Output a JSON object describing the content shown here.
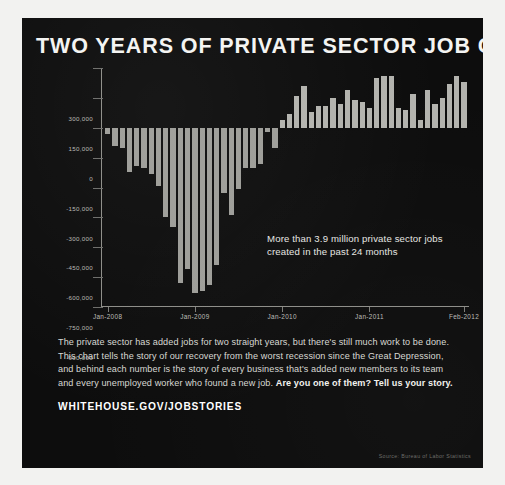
{
  "poster": {
    "title": "TWO YEARS OF PRIVATE SECTOR JOB GROWTH",
    "callout": "More than 3.9 million private sector jobs created in the past 24 months",
    "paragraph_part1": "The private sector has added jobs for two straight years, but there's still much work to be done. This chart tells the story of our recovery from the worst recession since the Great Depression, and behind each number is the story of every business that's added new members to its team and every unemployed worker who found a new job. ",
    "paragraph_emphasis": "Are you one of them? Tell us your story.",
    "cta": "WHITEHOUSE.GOV/JOBSTORIES",
    "source": "Source: Bureau of Labor Statistics",
    "background_color": "#0d0d0d",
    "bar_color": "#b3b3ae",
    "text_color": "#f4f4f2"
  },
  "chart_data": {
    "type": "bar",
    "title": "TWO YEARS OF PRIVATE SECTOR JOB GROWTH",
    "xlabel": "",
    "ylabel": "",
    "ylim": [
      -900000,
      300000
    ],
    "grid": true,
    "legend": "none",
    "ytick_labels": [
      "300,000",
      "150,000",
      "0",
      "-150,000",
      "-300,000",
      "-450,000",
      "-600,000",
      "-750,000",
      "-900,000"
    ],
    "ytick_values": [
      300000,
      150000,
      0,
      -150000,
      -300000,
      -450000,
      -600000,
      -750000,
      -900000
    ],
    "xtick_labels": [
      "Jan-2008",
      "Jan-2009",
      "Jan-2010",
      "Jan-2011",
      "Feb-2012"
    ],
    "xtick_indices": [
      0,
      12,
      24,
      36,
      49
    ],
    "annotations": [
      {
        "text": "More than 3.9 million private sector jobs created in the past 24 months",
        "x_index": 30,
        "y_value": -330000
      }
    ],
    "categories": [
      "Jan-2008",
      "Feb-2008",
      "Mar-2008",
      "Apr-2008",
      "May-2008",
      "Jun-2008",
      "Jul-2008",
      "Aug-2008",
      "Sep-2008",
      "Oct-2008",
      "Nov-2008",
      "Dec-2008",
      "Jan-2009",
      "Feb-2009",
      "Mar-2009",
      "Apr-2009",
      "May-2009",
      "Jun-2009",
      "Jul-2009",
      "Aug-2009",
      "Sep-2009",
      "Oct-2009",
      "Nov-2009",
      "Dec-2009",
      "Jan-2010",
      "Feb-2010",
      "Mar-2010",
      "Apr-2010",
      "May-2010",
      "Jun-2010",
      "Jul-2010",
      "Aug-2010",
      "Sep-2010",
      "Oct-2010",
      "Nov-2010",
      "Dec-2010",
      "Jan-2011",
      "Feb-2011",
      "Mar-2011",
      "Apr-2011",
      "May-2011",
      "Jun-2011",
      "Jul-2011",
      "Aug-2011",
      "Sep-2011",
      "Oct-2011",
      "Nov-2011",
      "Dec-2011",
      "Jan-2012",
      "Feb-2012"
    ],
    "values": [
      -30000,
      -90000,
      -100000,
      -220000,
      -190000,
      -200000,
      -230000,
      -290000,
      -450000,
      -500000,
      -780000,
      -710000,
      -830000,
      -820000,
      -790000,
      -690000,
      -330000,
      -440000,
      -310000,
      -200000,
      -200000,
      -180000,
      -20000,
      -100000,
      40000,
      70000,
      160000,
      210000,
      80000,
      110000,
      110000,
      150000,
      120000,
      190000,
      140000,
      130000,
      100000,
      250000,
      260000,
      260000,
      100000,
      90000,
      170000,
      40000,
      190000,
      120000,
      150000,
      220000,
      260000,
      230000
    ]
  }
}
